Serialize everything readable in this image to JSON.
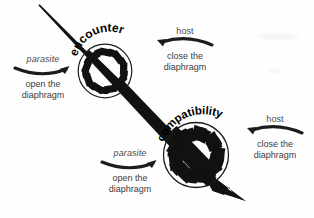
{
  "figure": {
    "type": "conceptual-diagram",
    "background_color": "#fefefe",
    "ink_color": "#000000",
    "text_color": "#3c3c3c"
  },
  "stages": [
    {
      "id": "encounter",
      "label": "encounter",
      "aperture_state": "open",
      "cx": 105,
      "cy": 71,
      "r": 27
    },
    {
      "id": "compatibility",
      "label": "compatibility",
      "aperture_state": "closed",
      "cx": 196,
      "cy": 155,
      "r": 33
    }
  ],
  "annotations": [
    {
      "id": "parasite-top",
      "actor": "parasite",
      "action_line1": "open the",
      "action_line2": "diaphragm",
      "arrow_direction": "right"
    },
    {
      "id": "host-top",
      "actor": "host",
      "action_line1": "close the",
      "action_line2": "diaphragm",
      "arrow_direction": "left"
    },
    {
      "id": "parasite-bottom",
      "actor": "parasite",
      "action_line1": "open the",
      "action_line2": "diaphragm",
      "arrow_direction": "right"
    },
    {
      "id": "host-bottom",
      "actor": "host",
      "action_line1": "close the",
      "action_line2": "diaphragm",
      "arrow_direction": "left"
    }
  ],
  "main_arrow": {
    "name": "process-arrow",
    "from": [
      38,
      6
    ],
    "to": [
      246,
      201
    ],
    "description": "tapering diagonal arrow from upper-left to lower-right"
  }
}
